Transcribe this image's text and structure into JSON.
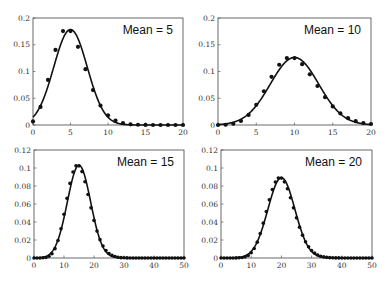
{
  "chart_data": [
    {
      "type": "scatter+line",
      "annotation": "Mean = 5",
      "mean": 5,
      "xlim": [
        0,
        20
      ],
      "ylim": [
        0,
        0.2
      ],
      "xticks": [
        0,
        5,
        10,
        15,
        20
      ],
      "yticks": [
        0,
        0.05,
        0.1,
        0.15,
        0.2
      ],
      "ytick_labels": [
        "0",
        "0.05",
        "0.1",
        "0.15",
        "0.2"
      ],
      "points": {
        "x": [
          0,
          1,
          2,
          3,
          4,
          5,
          6,
          7,
          8,
          9,
          10,
          11,
          12,
          13,
          14,
          15,
          16,
          17,
          18,
          19,
          20
        ],
        "y": [
          0.0067,
          0.0337,
          0.0842,
          0.1404,
          0.1755,
          0.1755,
          0.1462,
          0.1044,
          0.0653,
          0.0363,
          0.0181,
          0.0082,
          0.0034,
          0.0013,
          0.0005,
          0.0002,
          0.0,
          0.0,
          0.0,
          0.0,
          0.0
        ]
      },
      "curve": "normal approximation, mu=5, sigma=sqrt(5)"
    },
    {
      "type": "scatter+line",
      "annotation": "Mean = 10",
      "mean": 10,
      "xlim": [
        0,
        20
      ],
      "ylim": [
        0,
        0.2
      ],
      "xticks": [
        0,
        5,
        10,
        15,
        20
      ],
      "yticks": [
        0,
        0.05,
        0.1,
        0.15,
        0.2
      ],
      "ytick_labels": [
        "0",
        "0.05",
        "0.1",
        "0.15",
        "0.2"
      ],
      "points": {
        "x": [
          0,
          1,
          2,
          3,
          4,
          5,
          6,
          7,
          8,
          9,
          10,
          11,
          12,
          13,
          14,
          15,
          16,
          17,
          18,
          19,
          20
        ],
        "y": [
          0.0,
          0.0005,
          0.0023,
          0.0076,
          0.0189,
          0.0378,
          0.0631,
          0.0901,
          0.1126,
          0.1251,
          0.1251,
          0.1137,
          0.0948,
          0.0729,
          0.0521,
          0.0347,
          0.0217,
          0.0128,
          0.0071,
          0.0037,
          0.0019
        ]
      },
      "curve": "normal approximation, mu=10, sigma=sqrt(10)"
    },
    {
      "type": "scatter+line",
      "annotation": "Mean = 15",
      "mean": 15,
      "xlim": [
        0,
        50
      ],
      "ylim": [
        0,
        0.12
      ],
      "xticks": [
        0,
        10,
        20,
        30,
        40,
        50
      ],
      "yticks": [
        0,
        0.02,
        0.04,
        0.06,
        0.08,
        0.1,
        0.12
      ],
      "ytick_labels": [
        "0",
        "0.02",
        "0.04",
        "0.06",
        "0.08",
        "0.1",
        "0.12"
      ],
      "points": {
        "x": [
          0,
          1,
          2,
          3,
          4,
          5,
          6,
          7,
          8,
          9,
          10,
          11,
          12,
          13,
          14,
          15,
          16,
          17,
          18,
          19,
          20,
          21,
          22,
          23,
          24,
          25,
          26,
          27,
          28,
          29,
          30,
          31,
          32,
          33,
          34,
          35,
          36,
          37,
          38,
          39,
          40,
          41,
          42,
          43,
          44,
          45,
          46,
          47,
          48,
          49,
          50
        ],
        "y": [
          0.0,
          0.0,
          0.0,
          0.0002,
          0.0006,
          0.0019,
          0.0048,
          0.0104,
          0.0194,
          0.0324,
          0.0486,
          0.0663,
          0.0829,
          0.0956,
          0.1024,
          0.1024,
          0.096,
          0.0847,
          0.0706,
          0.0557,
          0.0418,
          0.0299,
          0.0204,
          0.0133,
          0.0083,
          0.005,
          0.0029,
          0.0016,
          0.0009,
          0.0004,
          0.0002,
          0.0001,
          0.0,
          0.0,
          0.0,
          0.0,
          0.0,
          0.0,
          0.0,
          0.0,
          0.0,
          0.0,
          0.0,
          0.0,
          0.0,
          0.0,
          0.0,
          0.0,
          0.0,
          0.0,
          0.0
        ]
      },
      "curve": "normal approximation, mu=15, sigma=sqrt(15)"
    },
    {
      "type": "scatter+line",
      "annotation": "Mean = 20",
      "mean": 20,
      "xlim": [
        0,
        50
      ],
      "ylim": [
        0,
        0.12
      ],
      "xticks": [
        0,
        10,
        20,
        30,
        40,
        50
      ],
      "yticks": [
        0,
        0.02,
        0.04,
        0.06,
        0.08,
        0.1,
        0.12
      ],
      "ytick_labels": [
        "0",
        "0.02",
        "0.04",
        "0.06",
        "0.08",
        "0.1",
        "0.12"
      ],
      "points": {
        "x": [
          0,
          1,
          2,
          3,
          4,
          5,
          6,
          7,
          8,
          9,
          10,
          11,
          12,
          13,
          14,
          15,
          16,
          17,
          18,
          19,
          20,
          21,
          22,
          23,
          24,
          25,
          26,
          27,
          28,
          29,
          30,
          31,
          32,
          33,
          34,
          35,
          36,
          37,
          38,
          39,
          40,
          41,
          42,
          43,
          44,
          45,
          46,
          47,
          48,
          49,
          50
        ],
        "y": [
          0.0,
          0.0,
          0.0,
          0.0,
          0.0,
          0.0001,
          0.0002,
          0.0005,
          0.0013,
          0.0029,
          0.0058,
          0.0106,
          0.0176,
          0.0271,
          0.0387,
          0.0516,
          0.0646,
          0.076,
          0.0844,
          0.0888,
          0.0888,
          0.0846,
          0.0769,
          0.0669,
          0.0557,
          0.0446,
          0.0343,
          0.0254,
          0.0181,
          0.0125,
          0.0083,
          0.0054,
          0.0034,
          0.002,
          0.0012,
          0.0007,
          0.0004,
          0.0002,
          0.0001,
          0.0001,
          0.0,
          0.0,
          0.0,
          0.0,
          0.0,
          0.0,
          0.0,
          0.0,
          0.0,
          0.0,
          0.0
        ]
      },
      "curve": "normal approximation, mu=20, sigma=sqrt(20)"
    }
  ]
}
